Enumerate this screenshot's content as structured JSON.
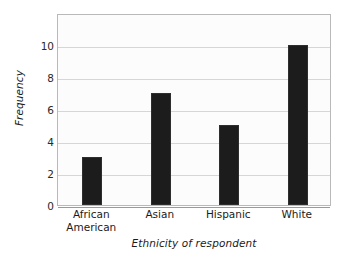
{
  "chart_data": {
    "type": "bar",
    "title": "",
    "subtitle": "",
    "categories": [
      "African American",
      "Asian",
      "Hispanic",
      "White"
    ],
    "category_lines": [
      [
        "African",
        "American"
      ],
      [
        "Asian"
      ],
      [
        "Hispanic"
      ],
      [
        "White"
      ]
    ],
    "values": [
      3,
      7,
      5,
      10
    ],
    "xlabel": "Ethnicity of respondent",
    "ylabel": "Frequency",
    "ylim": [
      0,
      12
    ],
    "yticks": [
      0,
      2,
      4,
      6,
      8,
      10
    ],
    "ytick_labels": [
      "0",
      "2",
      "4",
      "6",
      "8",
      "10"
    ],
    "grid": true,
    "grid_axis": "y",
    "legend": false,
    "legend_position": "none",
    "bar_color": "#1c1c1c",
    "plot_background": "#fcfcfc",
    "gridline_color": "#d6d6d6",
    "plot_border_color": "#b9b9b9",
    "bar_width_ratio": 0.29
  }
}
